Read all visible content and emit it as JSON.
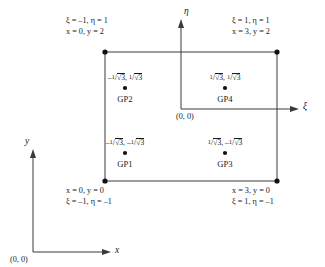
{
  "figure": {
    "line_color": "#3a3a3a",
    "text_color": "#1a1a1a",
    "background": "#ffffff"
  },
  "axes": {
    "natural": {
      "xi_label": "ξ",
      "eta_label": "η",
      "origin_label": "(0, 0)"
    },
    "global": {
      "x_label": "x",
      "y_label": "y",
      "origin_label": "(0, 0)"
    }
  },
  "corners": [
    {
      "id": "top-left",
      "natural": "ξ = –1, η = 1",
      "global": "x = 0, y = 2"
    },
    {
      "id": "top-right",
      "natural": "ξ = 1, η = 1",
      "global": "x = 3, y = 2"
    },
    {
      "id": "bottom-left",
      "global": "x = 0, y = 0",
      "natural": "ξ = –1, η = –1"
    },
    {
      "id": "bottom-right",
      "global": "x = 3, y = 0",
      "natural": "ξ = 1, η = –1"
    }
  ],
  "gauss_points": [
    {
      "name": "GP1",
      "xi_sign": "–",
      "eta_sign": "–",
      "coord_text": "–1/√3, –1/√3"
    },
    {
      "name": "GP2",
      "xi_sign": "–",
      "eta_sign": "",
      "coord_text": "–1/√3, 1/√3"
    },
    {
      "name": "GP3",
      "xi_sign": "",
      "eta_sign": "–",
      "coord_text": "1/√3, –1/√3"
    },
    {
      "name": "GP4",
      "xi_sign": "",
      "eta_sign": "",
      "coord_text": "1/√3, 1/√3"
    }
  ]
}
